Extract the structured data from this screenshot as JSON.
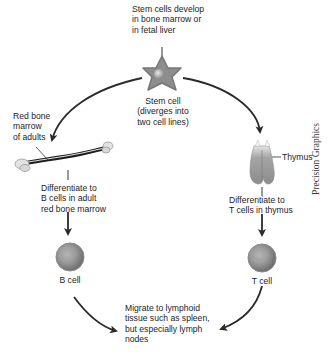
{
  "diagram": {
    "top_note": [
      "Stem cells develop",
      "in bone marrow or",
      "in fetal liver"
    ],
    "stem_cell_label": [
      "Stem cell",
      "(diverges into",
      "two cell lines)"
    ],
    "bone_label": [
      "Red bone",
      "marrow",
      "of adults"
    ],
    "b_differentiate": [
      "Differentiate to",
      "B cells in adult",
      "red bone marrow"
    ],
    "thymus_label": "Thymus",
    "t_differentiate": [
      "Differentiate to",
      "T cells in thymus"
    ],
    "b_cell_label": "B cell",
    "t_cell_label": "T cell",
    "migrate_note": [
      "Migrate to lymphoid",
      "tissue such as spleen,",
      "but especially lymph",
      "nodes"
    ],
    "credit": "Precision Graphics"
  },
  "colors": {
    "arrow": "#2a2a2a",
    "cell_body": "#8a8a8a",
    "cell_nucleus": "#c8c8c8",
    "thymus": "#9a9a9a"
  }
}
